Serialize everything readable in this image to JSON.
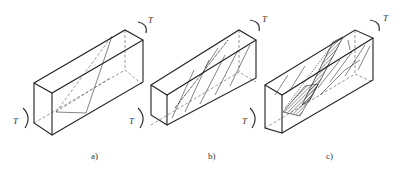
{
  "figure": {
    "panels": [
      {
        "id": "a",
        "caption": "a)",
        "torque_top": "T",
        "torque_bottom": "T",
        "state": "inclined principal-stress planes (dashed) at 45 degrees"
      },
      {
        "id": "b",
        "caption": "b)",
        "torque_top": "T",
        "torque_bottom": "T",
        "state": "spiral cracks forming along inclined planes"
      },
      {
        "id": "c",
        "caption": "c)",
        "torque_top": "T",
        "torque_bottom": "T",
        "state": "failure surface with crushed (hatched) compression zone"
      }
    ]
  },
  "colors": {
    "line": "#222222",
    "background": "#ffffff",
    "hatch": "#333333"
  }
}
